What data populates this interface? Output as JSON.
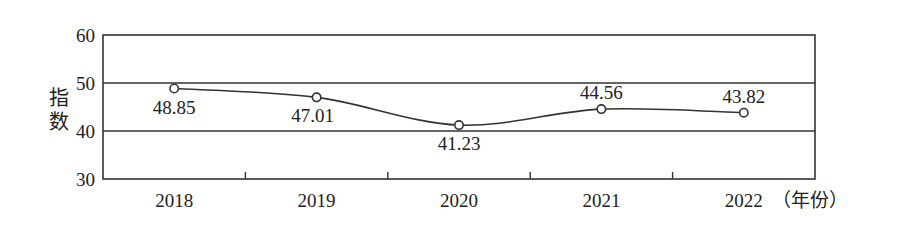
{
  "chart_data": {
    "type": "line",
    "title": "",
    "xlabel": "（年份）",
    "ylabel": "指数",
    "categories": [
      "2018",
      "2019",
      "2020",
      "2021",
      "2022"
    ],
    "series": [
      {
        "name": "指数",
        "values": [
          48.85,
          47.01,
          41.23,
          44.56,
          43.82
        ]
      }
    ],
    "data_labels": [
      "48.85",
      "47.01",
      "41.23",
      "44.56",
      "43.82"
    ],
    "yticks": [
      "30",
      "40",
      "50",
      "60"
    ],
    "ylim": [
      30,
      60
    ],
    "grid": "horizontal at 40, 50",
    "legend": "none",
    "smooth": true,
    "marker": "hollow-circle"
  },
  "labels": {
    "y_axis_title_line1": "指",
    "y_axis_title_line2": "数",
    "x_unit": "（年份）"
  }
}
